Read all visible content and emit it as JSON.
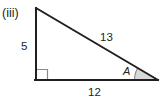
{
  "figure": {
    "part_label": "(iii)",
    "shape": "right-triangle",
    "background_color": "#ffffff",
    "stroke_color": "#231f20",
    "marker_color": "#8b8b8b",
    "angle_fill_color": "#d9d9d9",
    "vertices": {
      "apex": [
        36,
        8
      ],
      "right_angle": [
        36,
        80
      ],
      "angle_a": [
        158,
        80
      ]
    },
    "sides": [
      {
        "name": "vertical-leg",
        "label": "5",
        "from": "apex",
        "to": "right_angle"
      },
      {
        "name": "hypotenuse",
        "label": "13",
        "from": "apex",
        "to": "angle_a"
      },
      {
        "name": "base",
        "label": "12",
        "from": "right_angle",
        "to": "angle_a"
      }
    ],
    "angles": [
      {
        "name": "right-angle-marker",
        "label": "",
        "marker": "square",
        "vertex": "right_angle"
      },
      {
        "name": "angle-a",
        "label": "A",
        "marker": "arc-sector",
        "vertex": "angle_a"
      }
    ],
    "side_labels": {
      "vertical": "5",
      "hypotenuse": "13",
      "base": "12"
    },
    "angle_label": "A"
  }
}
